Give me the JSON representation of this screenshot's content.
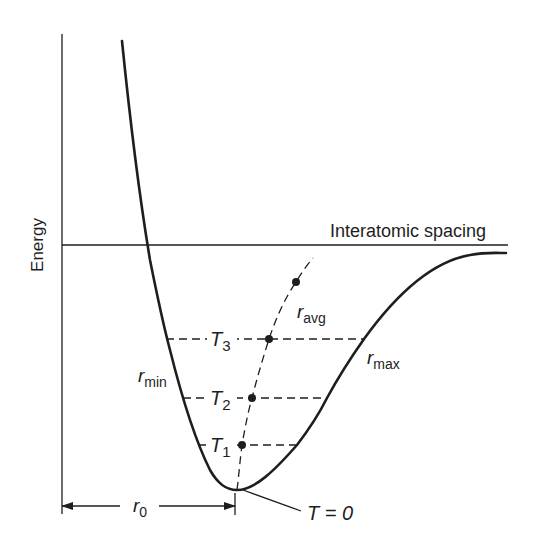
{
  "diagram": {
    "y_axis_label": "Energy",
    "x_axis_label": "Interatomic spacing",
    "curve_labels": {
      "r_min": {
        "main": "r",
        "sub": "min"
      },
      "r_max": {
        "main": "r",
        "sub": "max"
      },
      "r_avg": {
        "main": "r",
        "sub": "avg"
      }
    },
    "temperature_levels": [
      {
        "main": "T",
        "sub": "3"
      },
      {
        "main": "T",
        "sub": "2"
      },
      {
        "main": "T",
        "sub": "1"
      }
    ],
    "ground_label": "T = 0",
    "equilibrium_label": {
      "main": "r",
      "sub": "0"
    },
    "colors": {
      "line": "#1e1e1e",
      "background": "#ffffff"
    }
  }
}
